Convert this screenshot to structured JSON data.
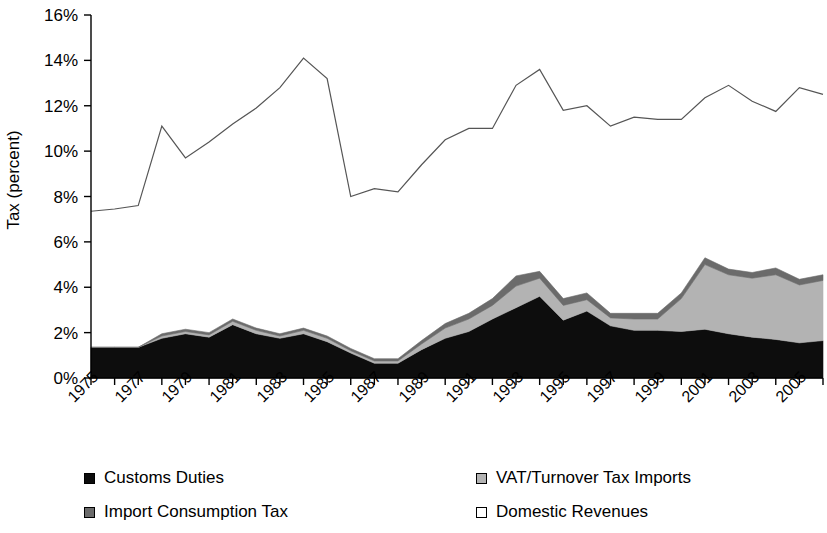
{
  "chart_data": {
    "type": "area",
    "title": "",
    "subtitle": "",
    "xlabel": "",
    "ylabel": "Tax (percent)",
    "xlim": [
      1975,
      2006
    ],
    "ylim": [
      0,
      16
    ],
    "ytick_labels": [
      "0%",
      "2%",
      "4%",
      "6%",
      "8%",
      "10%",
      "12%",
      "14%",
      "16%"
    ],
    "ytick_values": [
      0,
      2,
      4,
      6,
      8,
      10,
      12,
      14,
      16
    ],
    "grid": false,
    "legend_position": "bottom",
    "stacked": true,
    "x": [
      1975,
      1976,
      1977,
      1978,
      1979,
      1980,
      1981,
      1982,
      1983,
      1984,
      1985,
      1986,
      1987,
      1988,
      1989,
      1990,
      1991,
      1992,
      1993,
      1994,
      1995,
      1996,
      1997,
      1998,
      1999,
      2000,
      2001,
      2002,
      2003,
      2004,
      2005,
      2006
    ],
    "xtick_labels": [
      "1975",
      "1977",
      "1979",
      "1981",
      "1983",
      "1985",
      "1987",
      "1989",
      "1991",
      "1993",
      "1995",
      "1997",
      "1999",
      "2001",
      "2003",
      "2005"
    ],
    "series": [
      {
        "name": "Customs Duties",
        "color": "#0d0d0d",
        "stacked": true,
        "values": [
          1.35,
          1.35,
          1.35,
          1.75,
          1.95,
          1.8,
          2.35,
          1.95,
          1.75,
          1.95,
          1.6,
          1.1,
          0.65,
          0.65,
          1.25,
          1.75,
          2.05,
          2.6,
          3.1,
          3.6,
          2.55,
          2.95,
          2.3,
          2.1,
          2.1,
          2.05,
          2.15,
          1.95,
          1.8,
          1.7,
          1.55,
          1.65
        ]
      },
      {
        "name": "VAT/Turnover Tax Imports",
        "color": "#b3b3b3",
        "stacked": true,
        "values": [
          0.0,
          0.0,
          0.0,
          0.1,
          0.1,
          0.1,
          0.15,
          0.15,
          0.1,
          0.15,
          0.15,
          0.1,
          0.1,
          0.1,
          0.25,
          0.45,
          0.55,
          0.6,
          0.95,
          0.8,
          0.65,
          0.5,
          0.35,
          0.5,
          0.5,
          1.45,
          2.85,
          2.6,
          2.6,
          2.85,
          2.55,
          2.65
        ]
      },
      {
        "name": "Import Consumption Tax",
        "color": "#6b6b6b",
        "stacked": true,
        "values": [
          0.0,
          0.0,
          0.0,
          0.1,
          0.1,
          0.1,
          0.1,
          0.1,
          0.1,
          0.1,
          0.1,
          0.1,
          0.1,
          0.1,
          0.15,
          0.2,
          0.25,
          0.3,
          0.45,
          0.3,
          0.3,
          0.3,
          0.2,
          0.25,
          0.25,
          0.25,
          0.3,
          0.25,
          0.25,
          0.3,
          0.25,
          0.25
        ]
      },
      {
        "name": "Domestic Revenues",
        "color": "#ffffff",
        "stacked": false,
        "line_only": true,
        "values": [
          7.35,
          7.45,
          7.6,
          11.1,
          9.7,
          10.4,
          11.2,
          11.9,
          12.8,
          14.1,
          13.2,
          8.0,
          8.35,
          8.2,
          9.4,
          10.5,
          11.0,
          11.0,
          12.9,
          13.6,
          11.8,
          12.0,
          11.1,
          11.5,
          11.4,
          11.4,
          12.35,
          12.9,
          12.2,
          11.75,
          12.8,
          12.5
        ]
      }
    ]
  },
  "legend": {
    "items": [
      {
        "label": "Customs Duties",
        "color": "#0d0d0d"
      },
      {
        "label": "VAT/Turnover Tax Imports",
        "color": "#b3b3b3"
      },
      {
        "label": "Import Consumption Tax",
        "color": "#6b6b6b"
      },
      {
        "label": "Domestic Revenues",
        "color": "#ffffff"
      }
    ]
  }
}
